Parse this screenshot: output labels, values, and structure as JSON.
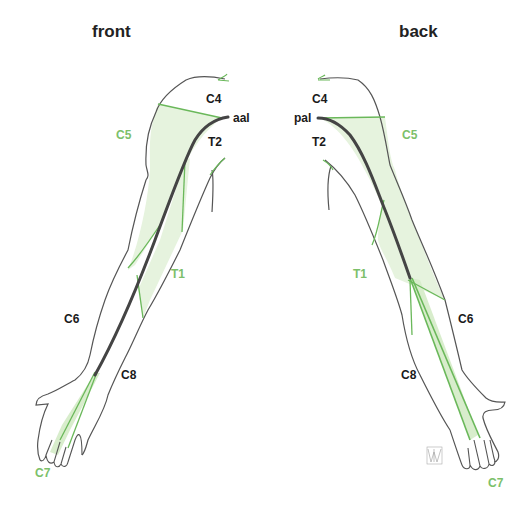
{
  "titles": {
    "front": "front",
    "back": "back"
  },
  "front": {
    "labels": {
      "c4": "C4",
      "aal": "aal",
      "c5": "C5",
      "t2": "T2",
      "t1": "T1",
      "c6": "C6",
      "c8": "C8",
      "c7": "C7"
    }
  },
  "back": {
    "labels": {
      "c4": "C4",
      "pal": "pal",
      "c5": "C5",
      "t2": "T2",
      "t1": "T1",
      "c6": "C6",
      "c8": "C8",
      "c7": "C7"
    }
  },
  "colors": {
    "outline": "#555555",
    "axial_line": "#444444",
    "dermatome_line": "#6ab85a",
    "dermatome_fill": "#e6f3de",
    "label_black": "#1a1a1a",
    "label_green": "#7cc06a"
  }
}
